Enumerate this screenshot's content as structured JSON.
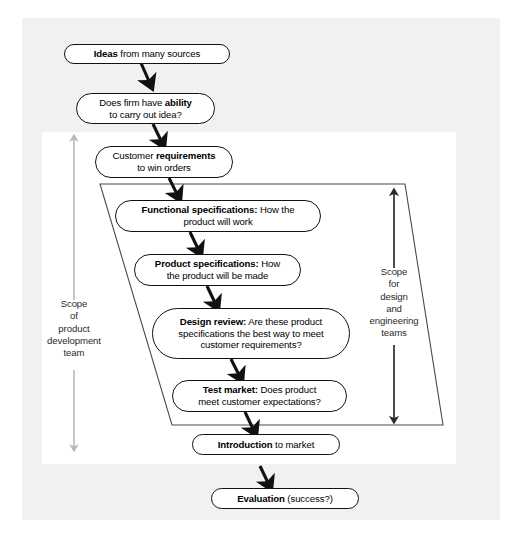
{
  "diagram": {
    "background_outer_color": "#f1f1f1",
    "background_panel_color": "#ffffff",
    "node_border_color": "#111111",
    "arrow_color": "#111111",
    "scope_arrow_color": "#b9b9b9",
    "design_arrow_color": "#2b2b2b",
    "nodes": [
      {
        "id": "ideas",
        "lines": [
          [
            {
              "t": "Ideas",
              "b": true
            },
            {
              "t": " from many sources",
              "b": false
            }
          ]
        ]
      },
      {
        "id": "ability",
        "lines": [
          [
            {
              "t": "Does firm have ",
              "b": false
            },
            {
              "t": "ability",
              "b": true
            }
          ],
          [
            {
              "t": "to carry out idea?",
              "b": false
            }
          ]
        ]
      },
      {
        "id": "customer-requirements",
        "lines": [
          [
            {
              "t": "Customer ",
              "b": false
            },
            {
              "t": "requirements",
              "b": true
            }
          ],
          [
            {
              "t": "to win orders",
              "b": false
            }
          ]
        ]
      },
      {
        "id": "functional-specifications",
        "lines": [
          [
            {
              "t": "Functional specifications:",
              "b": true
            },
            {
              "t": " How the",
              "b": false
            }
          ],
          [
            {
              "t": "product will work",
              "b": false
            }
          ]
        ]
      },
      {
        "id": "product-specifications",
        "lines": [
          [
            {
              "t": "Product specifications:",
              "b": true
            },
            {
              "t": " How",
              "b": false
            }
          ],
          [
            {
              "t": "the product will be made",
              "b": false
            }
          ]
        ]
      },
      {
        "id": "design-review",
        "lines": [
          [
            {
              "t": "Design review:",
              "b": true
            },
            {
              "t": " Are these product",
              "b": false
            }
          ],
          [
            {
              "t": "specifications the best way to meet",
              "b": false
            }
          ],
          [
            {
              "t": "customer requirements?",
              "b": false
            }
          ]
        ]
      },
      {
        "id": "test-market",
        "lines": [
          [
            {
              "t": "Test market:",
              "b": true
            },
            {
              "t": " Does product",
              "b": false
            }
          ],
          [
            {
              "t": "meet customer expectations?",
              "b": false
            }
          ]
        ]
      },
      {
        "id": "introduction",
        "lines": [
          [
            {
              "t": "Introduction",
              "b": true
            },
            {
              "t": " to market",
              "b": false
            }
          ]
        ]
      },
      {
        "id": "evaluation",
        "lines": [
          [
            {
              "t": "Evaluation",
              "b": true
            },
            {
              "t": " (success?)",
              "b": false
            }
          ]
        ]
      }
    ],
    "scope_left": {
      "id": "scope-of-product-development-team",
      "lines": [
        "Scope",
        "of",
        "product",
        "development",
        "team"
      ]
    },
    "scope_right": {
      "id": "scope-for-design-and-engineering-teams",
      "lines": [
        "Scope",
        "for",
        "design",
        "and",
        "engineering",
        "teams"
      ]
    }
  }
}
